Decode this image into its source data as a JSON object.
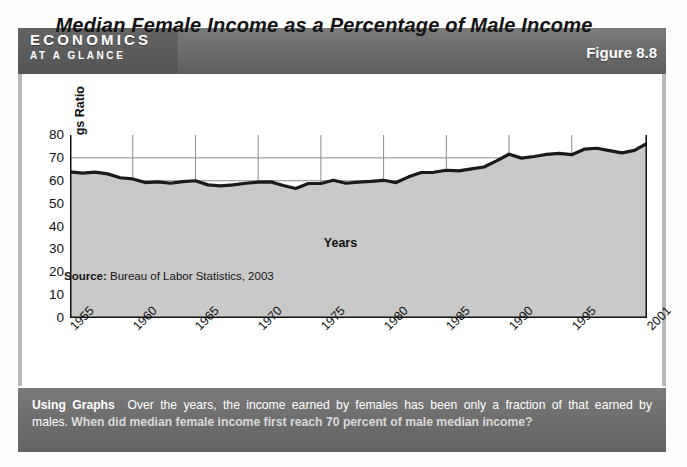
{
  "header": {
    "brand_line1": "ECONOMICS",
    "brand_line2": "AT A GLANCE",
    "figure_label": "Figure 8.8"
  },
  "figure": {
    "title": "Median Female Income as a Percentage of Male Income",
    "source": "Bureau of Labor Statistics, 2003",
    "source_prefix": "Source:"
  },
  "caption": {
    "lead": "Using Graphs",
    "text": "Over the years, the income earned by females has been only a fraction of that earned by males.",
    "question": "When did median female income first reach 70 percent of male median income?"
  },
  "colors": {
    "header_bar": "#6e6e6e",
    "caption_bar": "#6f6f6f",
    "area_fill": "#c9c9c9",
    "line": "#1a1a1a",
    "grid": "#8c8c8c",
    "plot_bg": "#ffffff"
  },
  "chart_data": {
    "type": "area",
    "title": "Median Female Income as a Percentage of Male Income",
    "xlabel": "Years",
    "ylabel": "Female/Male Earnings Ratio",
    "xlim": [
      1955,
      2001
    ],
    "ylim": [
      0,
      80
    ],
    "yticks": [
      0,
      10,
      20,
      30,
      40,
      50,
      60,
      70,
      80
    ],
    "xticks": [
      "1955",
      "1960",
      "1965",
      "1970",
      "1975",
      "1980",
      "1985",
      "1990",
      "1995",
      "2001"
    ],
    "xtick_values": [
      1955,
      1960,
      1965,
      1970,
      1975,
      1980,
      1985,
      1990,
      1995,
      2001
    ],
    "grid": true,
    "legend": false,
    "series": [
      {
        "name": "Female/Male Earnings Ratio",
        "x": [
          1955,
          1956,
          1957,
          1958,
          1959,
          1960,
          1961,
          1962,
          1963,
          1964,
          1965,
          1966,
          1967,
          1968,
          1969,
          1970,
          1971,
          1972,
          1973,
          1974,
          1975,
          1976,
          1977,
          1978,
          1979,
          1980,
          1981,
          1982,
          1983,
          1984,
          1985,
          1986,
          1987,
          1988,
          1989,
          1990,
          1991,
          1992,
          1993,
          1994,
          1995,
          1996,
          1997,
          1998,
          1999,
          2000,
          2001
        ],
        "values": [
          63.9,
          63.3,
          63.8,
          63.0,
          61.3,
          60.8,
          59.2,
          59.5,
          58.9,
          59.6,
          60.0,
          58.2,
          57.8,
          58.2,
          58.9,
          59.4,
          59.5,
          57.9,
          56.6,
          58.8,
          58.8,
          60.2,
          58.9,
          59.4,
          59.7,
          60.2,
          59.2,
          61.7,
          63.6,
          63.7,
          64.6,
          64.3,
          65.2,
          66.0,
          68.7,
          71.6,
          69.9,
          70.6,
          71.5,
          72.0,
          71.4,
          73.8,
          74.2,
          73.2,
          72.2,
          73.3,
          76.3
        ]
      }
    ]
  }
}
